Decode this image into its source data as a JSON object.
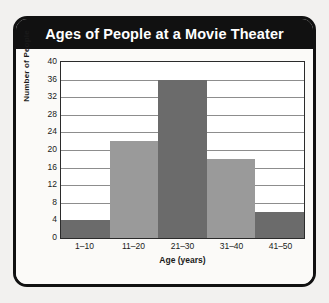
{
  "card": {
    "title": "Ages of People at a Movie Theater"
  },
  "chart_data": {
    "type": "bar",
    "title": "Ages of People at a Movie Theater",
    "categories": [
      "1–10",
      "11–20",
      "21–30",
      "31–40",
      "41–50"
    ],
    "values": [
      4,
      22,
      36,
      18,
      6
    ],
    "bar_colors": [
      "#6b6b6b",
      "#9a9a9a",
      "#6b6b6b",
      "#9a9a9a",
      "#6b6b6b"
    ],
    "xlabel": "Age (years)",
    "ylabel": "Number of People",
    "ylim": [
      0,
      40
    ],
    "ytick_step": 4,
    "yticks": [
      0,
      4,
      8,
      12,
      16,
      20,
      24,
      28,
      32,
      36,
      40
    ],
    "ytick_labels": [
      "0",
      "4",
      "8",
      "12",
      "16",
      "20",
      "24",
      "28",
      "32",
      "36",
      "40"
    ],
    "grid": true,
    "legend": false,
    "bar_gap": 0
  },
  "colors": {
    "header_bg": "#111111",
    "header_text": "#ffffff",
    "card_border": "#111111",
    "page_bg": "#f2f1ef",
    "plot_bg": "#ffffff",
    "gridline": "#8d8d8d",
    "axis": "#2b2b2b",
    "bar_dark": "#6b6b6b",
    "bar_light": "#9a9a9a"
  }
}
